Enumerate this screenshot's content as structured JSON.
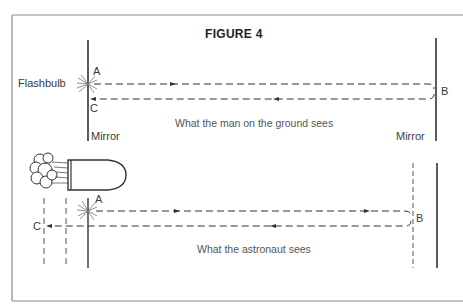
{
  "figure": {
    "title": "FIGURE 4",
    "colors": {
      "ink": "#333333",
      "frame": "#8a8a8a",
      "background": "#ffffff"
    }
  },
  "top_panel": {
    "caption": "What the man on the ground sees",
    "labels": {
      "flashbulb": "Flashbulb",
      "point_a": "A",
      "point_b": "B",
      "point_c": "C",
      "left_mirror": "Mirror",
      "right_mirror": "Mirror"
    }
  },
  "bottom_panel": {
    "caption": "What the astronaut sees",
    "labels": {
      "point_a": "A",
      "point_b": "B",
      "point_c": "C"
    }
  }
}
